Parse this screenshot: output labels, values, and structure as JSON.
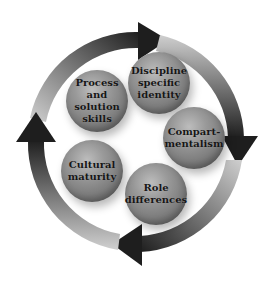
{
  "diagram": {
    "type": "cycle",
    "direction": "clockwise",
    "arrow_count": 4,
    "colors": {
      "arrow_dark": "#1e1e1e",
      "arrow_light": "#c8c8c8",
      "sphere": "#8a8a8a",
      "text": "#161616",
      "background": "#ffffff"
    },
    "nodes": [
      {
        "id": "process",
        "label": "Process\nand\nsolution\nskills"
      },
      {
        "id": "discipline",
        "label": "Discipline\nspecific\nidentity"
      },
      {
        "id": "compart",
        "label": "Compart-\nmentalism"
      },
      {
        "id": "role",
        "label": "Role\ndifferences"
      },
      {
        "id": "cultural",
        "label": "Cultural\nmaturity"
      }
    ]
  }
}
